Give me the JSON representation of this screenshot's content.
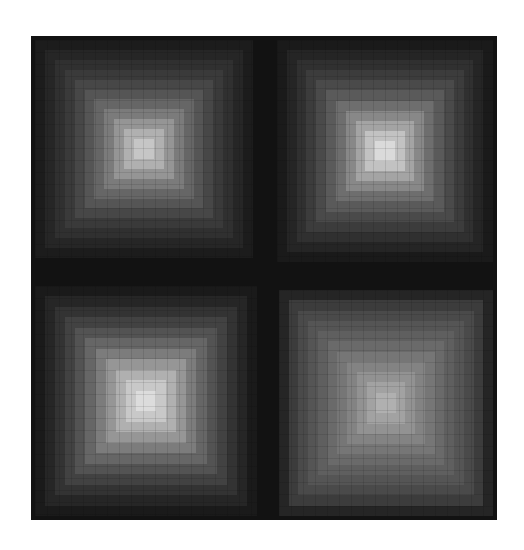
{
  "artwork": {
    "background": "#ffffff",
    "frame_color": "#121212",
    "panels": [
      {
        "id": "top-left",
        "x": 4,
        "y": 4,
        "w": 218,
        "h": 218,
        "rings": [
          "#1c1c1c",
          "#262626",
          "#303030",
          "#3a3a3a",
          "#474747",
          "#555555",
          "#666666",
          "#7b7b7b",
          "#959595",
          "#b0b0b0",
          "#c6c6c6"
        ]
      },
      {
        "id": "top-right",
        "x": 246,
        "y": 4,
        "w": 216,
        "h": 222,
        "rings": [
          "#1a1a1a",
          "#252525",
          "#303030",
          "#3c3c3c",
          "#4a4a4a",
          "#5a5a5a",
          "#6e6e6e",
          "#888888",
          "#a4a4a4",
          "#c2c2c2",
          "#dadada"
        ]
      },
      {
        "id": "bottom-left",
        "x": 4,
        "y": 250,
        "w": 222,
        "h": 230,
        "rings": [
          "#1a1a1a",
          "#262626",
          "#333333",
          "#424242",
          "#535353",
          "#666666",
          "#7c7c7c",
          "#969696",
          "#b0b0b0",
          "#c8c8c8",
          "#dcdcdc"
        ]
      },
      {
        "id": "bottom-right",
        "x": 248,
        "y": 254,
        "w": 214,
        "h": 226,
        "rings": [
          "#252525",
          "#3c3c3c",
          "#4a4a4a",
          "#555555",
          "#5f5f5f",
          "#6a6a6a",
          "#767676",
          "#838383",
          "#929292",
          "#a2a2a2",
          "#b0b0b0"
        ]
      }
    ]
  }
}
